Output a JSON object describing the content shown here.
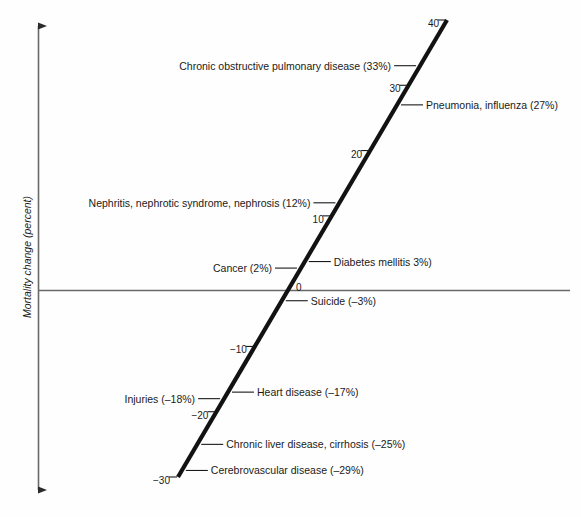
{
  "chart_data": {
    "type": "line",
    "title": "",
    "xlabel": "",
    "ylabel": "Mortality change (percent)",
    "grid": false,
    "legend": null,
    "axis_ticks": [
      "40",
      "30",
      "20",
      "10",
      "0",
      "−10",
      "−20",
      "−30"
    ],
    "axis_tick_values": [
      40,
      30,
      20,
      10,
      0,
      -10,
      -20,
      -30
    ],
    "axis_range": [
      -31.5,
      42
    ],
    "categories": [
      "Chronic obstructive pulmonary disease",
      "Pneumonia, influenza",
      "Nephritis, nephrotic syndrome, nephrosis",
      "Diabetes mellitis",
      "Cancer",
      "Suicide",
      "Heart disease",
      "Injuries",
      "Chronic liver disease, cirrhosis",
      "Cerebrovascular disease"
    ],
    "values": [
      33,
      27,
      12,
      3,
      2,
      -3,
      -17,
      -18,
      -25,
      -29
    ]
  },
  "axis": {
    "y_title": "Mortality change (percent)",
    "zero_label": "0"
  },
  "ticks": [
    {
      "label": "40",
      "value": 40
    },
    {
      "label": "30",
      "value": 30
    },
    {
      "label": "20",
      "value": 20
    },
    {
      "label": "10",
      "value": 10
    },
    {
      "label": "−10",
      "value": -10
    },
    {
      "label": "−20",
      "value": -20
    },
    {
      "label": "−30",
      "value": -30
    }
  ],
  "annotations": [
    {
      "text": "Chronic obstructive pulmonary disease (33%)",
      "value": 33,
      "side": "left"
    },
    {
      "text": "Pneumonia, influenza (27%)",
      "value": 27,
      "side": "right"
    },
    {
      "text": "Nephritis, nephrotic syndrome, nephrosis (12%)",
      "value": 12,
      "side": "left"
    },
    {
      "text": "Diabetes mellitis 3%)",
      "value": 3,
      "side": "right"
    },
    {
      "text": "Cancer (2%)",
      "value": 2,
      "side": "left"
    },
    {
      "text": "Suicide (–3%)",
      "value": -3,
      "side": "right"
    },
    {
      "text": "Heart disease (–17%)",
      "value": -17,
      "side": "right"
    },
    {
      "text": "Injuries (–18%)",
      "value": -18,
      "side": "left"
    },
    {
      "text": "Chronic liver disease, cirrhosis (–25%)",
      "value": -25,
      "side": "right"
    },
    {
      "text": "Cerebrovascular disease (–29%)",
      "value": -29,
      "side": "right"
    }
  ],
  "colors": {
    "ink": "#1a1a1a",
    "axis": "#4a4a4a",
    "background": "#fefefe"
  }
}
